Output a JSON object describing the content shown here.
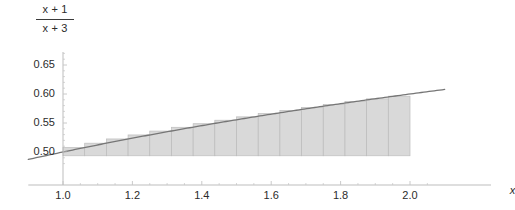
{
  "chart_data": {
    "type": "area",
    "title_numerator": "x + 1",
    "title_denominator": "x + 3",
    "xlabel": "x",
    "ylabel": "",
    "xlim": [
      0.9,
      2.1
    ],
    "ylim": [
      0.478,
      0.672
    ],
    "grid": false,
    "legend": null,
    "xticks": [
      1.0,
      1.2,
      1.4,
      1.6,
      1.8,
      2.0
    ],
    "xtick_labels": [
      "1.0",
      "1.2",
      "1.4",
      "1.6",
      "1.8",
      "2.0"
    ],
    "xminor_ticks": [
      1.05,
      1.1,
      1.15,
      1.25,
      1.3,
      1.35,
      1.45,
      1.5,
      1.55,
      1.65,
      1.7,
      1.75,
      1.85,
      1.9,
      1.95,
      2.05
    ],
    "yticks": [
      0.5,
      0.55,
      0.6,
      0.65
    ],
    "ytick_labels": [
      "0.50",
      "0.55",
      "0.60",
      "0.65"
    ],
    "yminor_ticks": [
      0.51,
      0.52,
      0.53,
      0.54,
      0.56,
      0.57,
      0.58,
      0.59,
      0.61,
      0.62,
      0.63,
      0.64,
      0.66,
      0.67,
      0.49,
      0.48
    ],
    "series": [
      {
        "name": "(x+1)/(x+3)",
        "type": "line",
        "color": "#767676",
        "x": [
          0.9,
          1.0,
          1.1,
          1.2,
          1.3,
          1.4,
          1.5,
          1.6,
          1.7,
          1.8,
          1.9,
          2.0,
          2.1
        ],
        "values": [
          0.4872,
          0.5,
          0.5122,
          0.5238,
          0.5349,
          0.5455,
          0.5556,
          0.5652,
          0.5745,
          0.5833,
          0.5918,
          0.6,
          0.6078
        ]
      },
      {
        "name": "Riemann rectangles",
        "type": "bar",
        "color": "#d2d2d2",
        "edge_color": "#bdbdbd",
        "bar_width": 0.0625,
        "baseline": 0.4935,
        "x_left": [
          1.0,
          1.0625,
          1.125,
          1.1875,
          1.25,
          1.3125,
          1.375,
          1.4375,
          1.5,
          1.5625,
          1.625,
          1.6875,
          1.75,
          1.8125,
          1.875,
          1.9375
        ],
        "x_right": [
          1.0625,
          1.125,
          1.1875,
          1.25,
          1.3125,
          1.375,
          1.4375,
          1.5,
          1.5625,
          1.625,
          1.6875,
          1.75,
          1.8125,
          1.875,
          1.9375,
          2.0
        ],
        "values": [
          0.5077,
          0.5152,
          0.5225,
          0.5294,
          0.5361,
          0.5426,
          0.5488,
          0.5548,
          0.5606,
          0.5662,
          0.5716,
          0.5769,
          0.582,
          0.5869,
          0.5916,
          0.5962
        ]
      }
    ]
  },
  "axes": {
    "x_axis_label": "x",
    "axis_color": "#b6b6b6",
    "tick_color": "#c4c4c4",
    "label_color": "#2b2b2b"
  }
}
